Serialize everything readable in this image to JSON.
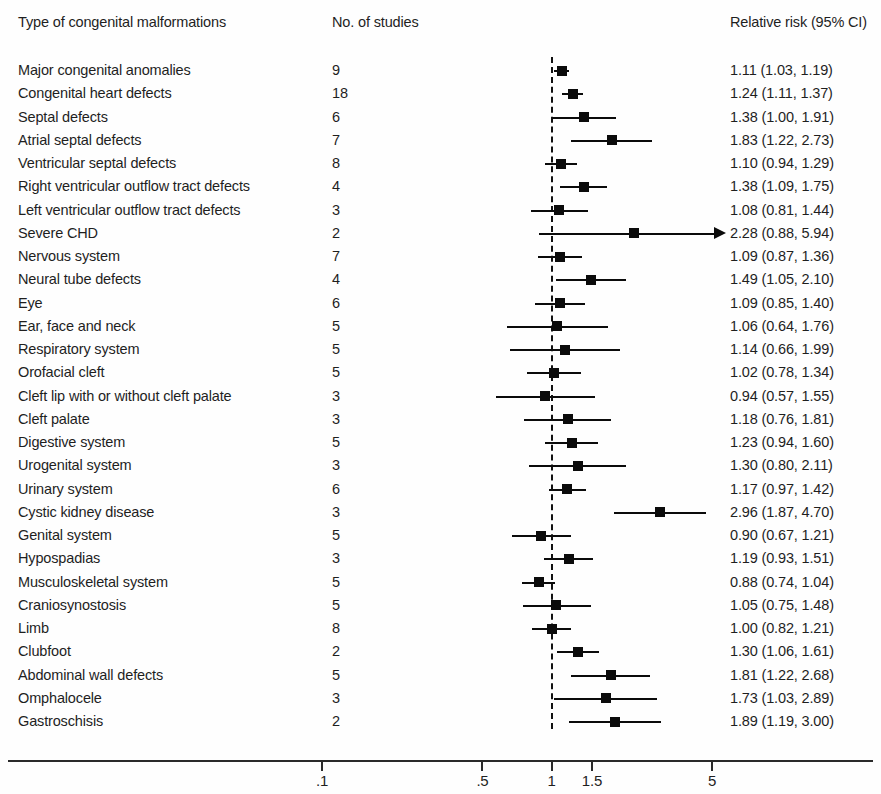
{
  "header": {
    "label_col": "Type of congenital malformations",
    "studies_col": "No. of studies",
    "rr_col": "Relative risk (95% CI)"
  },
  "axis": {
    "ticks": [
      ".1",
      ".5",
      "1",
      "1.5",
      "5"
    ],
    "tick_values": [
      0.1,
      0.5,
      1,
      1.5,
      5
    ],
    "scale": "log",
    "null_value": 1
  },
  "chart_data": {
    "type": "forest",
    "title": "",
    "xlabel": "",
    "ylabel": "",
    "xscale": "log",
    "xlim": [
      0.1,
      6.0
    ],
    "null_line": 1,
    "grid": false,
    "legend": "none",
    "columns": [
      "Type of congenital malformations",
      "No. of studies",
      "Relative risk (95% CI)"
    ],
    "rows": [
      {
        "label": "Major congenital anomalies",
        "studies": "9",
        "rr_text": "1.11 (1.03, 1.19)",
        "rr": 1.11,
        "lo": 1.03,
        "hi": 1.19,
        "truncated": false
      },
      {
        "label": "Congenital heart defects",
        "studies": "18",
        "rr_text": "1.24 (1.11, 1.37)",
        "rr": 1.24,
        "lo": 1.11,
        "hi": 1.37,
        "truncated": false
      },
      {
        "label": "Septal defects",
        "studies": "6",
        "rr_text": "1.38 (1.00, 1.91)",
        "rr": 1.38,
        "lo": 1.0,
        "hi": 1.91,
        "truncated": false
      },
      {
        "label": "Atrial septal defects",
        "studies": "7",
        "rr_text": "1.83 (1.22, 2.73)",
        "rr": 1.83,
        "lo": 1.22,
        "hi": 2.73,
        "truncated": false
      },
      {
        "label": "Ventricular septal defects",
        "studies": "8",
        "rr_text": "1.10 (0.94, 1.29)",
        "rr": 1.1,
        "lo": 0.94,
        "hi": 1.29,
        "truncated": false
      },
      {
        "label": "Right ventricular outflow tract defects",
        "studies": "4",
        "rr_text": "1.38 (1.09, 1.75)",
        "rr": 1.38,
        "lo": 1.09,
        "hi": 1.75,
        "truncated": false
      },
      {
        "label": "Left ventricular outflow tract defects",
        "studies": "3",
        "rr_text": "1.08 (0.81, 1.44)",
        "rr": 1.08,
        "lo": 0.81,
        "hi": 1.44,
        "truncated": false
      },
      {
        "label": "Severe CHD",
        "studies": "2",
        "rr_text": "2.28 (0.88, 5.94)",
        "rr": 2.28,
        "lo": 0.88,
        "hi": 5.94,
        "truncated": true
      },
      {
        "label": "Nervous system",
        "studies": "7",
        "rr_text": "1.09 (0.87, 1.36)",
        "rr": 1.09,
        "lo": 0.87,
        "hi": 1.36,
        "truncated": false
      },
      {
        "label": "Neural tube defects",
        "studies": "4",
        "rr_text": "1.49 (1.05, 2.10)",
        "rr": 1.49,
        "lo": 1.05,
        "hi": 2.1,
        "truncated": false
      },
      {
        "label": "Eye",
        "studies": "6",
        "rr_text": "1.09 (0.85, 1.40)",
        "rr": 1.09,
        "lo": 0.85,
        "hi": 1.4,
        "truncated": false
      },
      {
        "label": "Ear, face and neck",
        "studies": "5",
        "rr_text": "1.06 (0.64, 1.76)",
        "rr": 1.06,
        "lo": 0.64,
        "hi": 1.76,
        "truncated": false
      },
      {
        "label": "Respiratory system",
        "studies": "5",
        "rr_text": "1.14 (0.66, 1.99)",
        "rr": 1.14,
        "lo": 0.66,
        "hi": 1.99,
        "truncated": false
      },
      {
        "label": "Orofacial cleft",
        "studies": "5",
        "rr_text": "1.02 (0.78, 1.34)",
        "rr": 1.02,
        "lo": 0.78,
        "hi": 1.34,
        "truncated": false
      },
      {
        "label": "Cleft lip with or without cleft palate",
        "studies": "3",
        "rr_text": "0.94 (0.57, 1.55)",
        "rr": 0.94,
        "lo": 0.57,
        "hi": 1.55,
        "truncated": false
      },
      {
        "label": "Cleft palate",
        "studies": "3",
        "rr_text": "1.18 (0.76, 1.81)",
        "rr": 1.18,
        "lo": 0.76,
        "hi": 1.81,
        "truncated": false
      },
      {
        "label": "Digestive system",
        "studies": "5",
        "rr_text": "1.23 (0.94, 1.60)",
        "rr": 1.23,
        "lo": 0.94,
        "hi": 1.6,
        "truncated": false
      },
      {
        "label": "Urogenital system",
        "studies": "3",
        "rr_text": "1.30 (0.80, 2.11)",
        "rr": 1.3,
        "lo": 0.8,
        "hi": 2.11,
        "truncated": false
      },
      {
        "label": "Urinary system",
        "studies": "6",
        "rr_text": "1.17 (0.97, 1.42)",
        "rr": 1.17,
        "lo": 0.97,
        "hi": 1.42,
        "truncated": false
      },
      {
        "label": "Cystic kidney disease",
        "studies": "3",
        "rr_text": "2.96 (1.87, 4.70)",
        "rr": 2.96,
        "lo": 1.87,
        "hi": 4.7,
        "truncated": false
      },
      {
        "label": "Genital system",
        "studies": "5",
        "rr_text": "0.90 (0.67, 1.21)",
        "rr": 0.9,
        "lo": 0.67,
        "hi": 1.21,
        "truncated": false
      },
      {
        "label": "Hypospadias",
        "studies": "3",
        "rr_text": "1.19 (0.93, 1.51)",
        "rr": 1.19,
        "lo": 0.93,
        "hi": 1.51,
        "truncated": false
      },
      {
        "label": "Musculoskeletal system",
        "studies": "5",
        "rr_text": "0.88 (0.74, 1.04)",
        "rr": 0.88,
        "lo": 0.74,
        "hi": 1.04,
        "truncated": false
      },
      {
        "label": "Craniosynostosis",
        "studies": "5",
        "rr_text": "1.05 (0.75, 1.48)",
        "rr": 1.05,
        "lo": 0.75,
        "hi": 1.48,
        "truncated": false
      },
      {
        "label": "Limb",
        "studies": "8",
        "rr_text": "1.00 (0.82, 1.21)",
        "rr": 1.0,
        "lo": 0.82,
        "hi": 1.21,
        "truncated": false
      },
      {
        "label": "Clubfoot",
        "studies": "2",
        "rr_text": "1.30 (1.06, 1.61)",
        "rr": 1.3,
        "lo": 1.06,
        "hi": 1.61,
        "truncated": false
      },
      {
        "label": "Abdominal wall defects",
        "studies": "5",
        "rr_text": "1.81 (1.22, 2.68)",
        "rr": 1.81,
        "lo": 1.22,
        "hi": 2.68,
        "truncated": false
      },
      {
        "label": "Omphalocele",
        "studies": "3",
        "rr_text": "1.73 (1.03, 2.89)",
        "rr": 1.73,
        "lo": 1.03,
        "hi": 2.89,
        "truncated": false
      },
      {
        "label": "Gastroschisis",
        "studies": "2",
        "rr_text": "1.89 (1.19, 3.00)",
        "rr": 1.89,
        "lo": 1.19,
        "hi": 3.0,
        "truncated": false
      }
    ]
  },
  "colors": {
    "marker": "#0b0b0b",
    "line": "#0b0b0b",
    "text": "#1f1f1f",
    "axis": "#2a2a2a",
    "background": "#fefefe"
  }
}
